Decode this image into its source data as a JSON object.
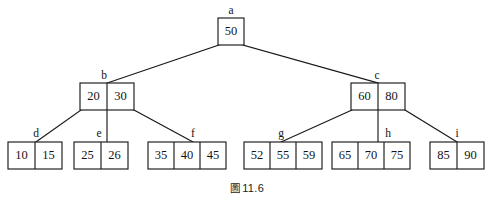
{
  "figure": {
    "caption_prefix": "圖",
    "caption_number": "11.6",
    "caption_full": "圖 11.6",
    "stroke_color": "#1a1a1a",
    "background_color": "#ffffff",
    "text_color": "#141414"
  },
  "tree": {
    "type": "b-tree",
    "levels": 3,
    "nodes": [
      {
        "id": "a",
        "label": "a",
        "level": 0,
        "keys": [
          "50"
        ],
        "x": 218,
        "y": 18,
        "cell_width": 26,
        "height": 27,
        "label_x": 231,
        "label_y": 11
      },
      {
        "id": "b",
        "label": "b",
        "level": 1,
        "keys": [
          "20",
          "30"
        ],
        "x": 80,
        "y": 83,
        "cell_width": 27,
        "height": 27,
        "label_x": 104,
        "label_y": 76
      },
      {
        "id": "c",
        "label": "c",
        "level": 1,
        "keys": [
          "60",
          "80"
        ],
        "x": 351,
        "y": 83,
        "cell_width": 27,
        "height": 27,
        "label_x": 377,
        "label_y": 76
      },
      {
        "id": "d",
        "label": "d",
        "level": 2,
        "keys": [
          "10",
          "15"
        ],
        "x": 8,
        "y": 142,
        "cell_width": 27,
        "height": 27,
        "label_x": 36,
        "label_y": 134
      },
      {
        "id": "e",
        "label": "e",
        "level": 2,
        "keys": [
          "25",
          "26"
        ],
        "x": 74,
        "y": 142,
        "cell_width": 27,
        "height": 27,
        "label_x": 99,
        "label_y": 134
      },
      {
        "id": "f",
        "label": "f",
        "level": 2,
        "keys": [
          "35",
          "40",
          "45"
        ],
        "x": 148,
        "y": 142,
        "cell_width": 26,
        "height": 27,
        "label_x": 193,
        "label_y": 134
      },
      {
        "id": "g",
        "label": "g",
        "level": 2,
        "keys": [
          "52",
          "55",
          "59"
        ],
        "x": 244,
        "y": 142,
        "cell_width": 26,
        "height": 27,
        "label_x": 281,
        "label_y": 134
      },
      {
        "id": "h",
        "label": "h",
        "level": 2,
        "keys": [
          "65",
          "70",
          "75"
        ],
        "x": 332,
        "y": 142,
        "cell_width": 26,
        "height": 27,
        "label_x": 388,
        "label_y": 134
      },
      {
        "id": "i",
        "label": "i",
        "level": 2,
        "keys": [
          "85",
          "90"
        ],
        "x": 430,
        "y": 142,
        "cell_width": 27,
        "height": 27,
        "label_x": 457,
        "label_y": 134
      }
    ],
    "edges": [
      {
        "from": "a",
        "to": "b",
        "x1": 219,
        "y1": 45,
        "x2": 107,
        "y2": 83
      },
      {
        "from": "a",
        "to": "c",
        "x1": 243,
        "y1": 45,
        "x2": 378,
        "y2": 83
      },
      {
        "from": "b",
        "to": "d",
        "x1": 81,
        "y1": 110,
        "x2": 36,
        "y2": 142
      },
      {
        "from": "b",
        "to": "e",
        "x1": 107,
        "y1": 110,
        "x2": 107,
        "y2": 142
      },
      {
        "from": "b",
        "to": "f",
        "x1": 134,
        "y1": 110,
        "x2": 193,
        "y2": 142
      },
      {
        "from": "c",
        "to": "g",
        "x1": 352,
        "y1": 110,
        "x2": 281,
        "y2": 142
      },
      {
        "from": "c",
        "to": "h",
        "x1": 378,
        "y1": 110,
        "x2": 378,
        "y2": 142
      },
      {
        "from": "c",
        "to": "i",
        "x1": 405,
        "y1": 110,
        "x2": 457,
        "y2": 142
      }
    ]
  }
}
